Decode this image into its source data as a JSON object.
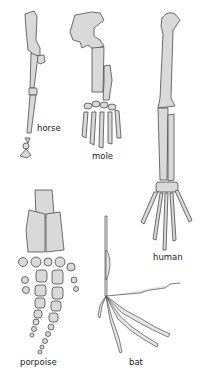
{
  "figure": {
    "labels": {
      "horse": "horse",
      "mole": "mole",
      "human": "human",
      "porpoise": "porpoise",
      "bat": "bat"
    },
    "colors": {
      "bone_fill": "#d9d9d9",
      "bone_stroke": "#4a4a4a",
      "label_text": "#222222",
      "background": "#ffffff"
    }
  }
}
